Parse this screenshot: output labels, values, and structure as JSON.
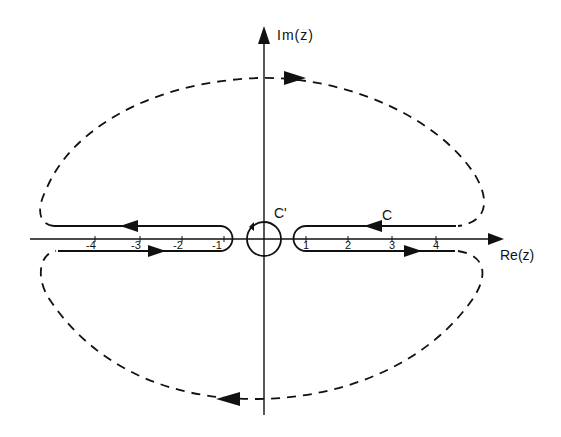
{
  "diagram": {
    "axes": {
      "x_label": "Re(z)",
      "y_label": "Im(z)"
    },
    "contours": {
      "outer_label": "C",
      "inner_label": "C'"
    },
    "ticks": {
      "negative": [
        "-4",
        "-3",
        "-2",
        "-1"
      ],
      "positive": [
        "1",
        "2",
        "3",
        "4"
      ]
    },
    "colors": {
      "ink": "#111111",
      "background": "#ffffff"
    }
  }
}
